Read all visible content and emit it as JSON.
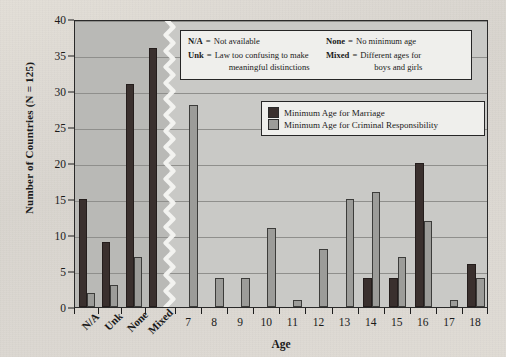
{
  "chart_data": {
    "type": "bar",
    "title": "",
    "xlabel": "Age",
    "ylabel": "Number of Countries (N = 125)",
    "ylim": [
      0,
      40
    ],
    "ytick_values": [
      0,
      5,
      10,
      15,
      20,
      25,
      30,
      35,
      40
    ],
    "grid": true,
    "legend_position": "inside-top-right",
    "axis_break_after_category": "Mixed",
    "categories": [
      "N/A",
      "Unk",
      "None",
      "Mixed",
      "7",
      "8",
      "9",
      "10",
      "11",
      "12",
      "13",
      "14",
      "15",
      "16",
      "17",
      "18"
    ],
    "series": [
      {
        "name": "Minimum Age for Marriage",
        "color": "#3a302e",
        "values": [
          15,
          9,
          31,
          36,
          0,
          0,
          0,
          0,
          0,
          0,
          0,
          4,
          4,
          20,
          0,
          6
        ]
      },
      {
        "name": "Minimum Age for Criminal Responsibility",
        "color": "#9c9c99",
        "values": [
          2,
          3,
          7,
          0,
          28,
          4,
          4,
          11,
          1,
          8,
          15,
          16,
          7,
          12,
          1,
          4
        ]
      }
    ],
    "annotations": {
      "abbreviations": [
        {
          "key": "N/A",
          "eq": "=",
          "definition": "Not available"
        },
        {
          "key": "Unk",
          "eq": "=",
          "definition": "Law too confusing to make",
          "definition_line2": "meaningful distinctions"
        },
        {
          "key": "None",
          "eq": "=",
          "definition": "No minimum age"
        },
        {
          "key": "Mixed",
          "eq": "=",
          "definition": "Different ages for",
          "definition_line2": "boys and girls"
        }
      ]
    }
  },
  "colors": {
    "page_background": "#ddd9d2",
    "plot_background": "#c9c9c6",
    "plot_background_left": "#b9b9b6",
    "gridline": "#8f8f8c",
    "axis": "#1d1d1d",
    "series_dark": "#3a302e",
    "series_light": "#9c9c99",
    "legend_background": "#efefec"
  }
}
